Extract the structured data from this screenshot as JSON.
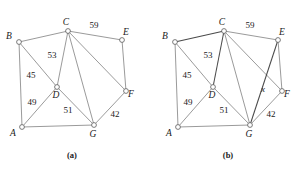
{
  "figure": {
    "kind": "weighted-graph-pair",
    "panels": [
      {
        "id": "a",
        "caption": "(a)",
        "origin_x": 0,
        "vertices": [
          {
            "id": "A",
            "label": "A",
            "x": 22,
            "y": 127,
            "label_dx": -9,
            "label_dy": 9
          },
          {
            "id": "B",
            "label": "B",
            "x": 19,
            "y": 42,
            "label_dx": -10,
            "label_dy": -3
          },
          {
            "id": "C",
            "label": "C",
            "x": 68,
            "y": 31,
            "label_dx": -2,
            "label_dy": -6
          },
          {
            "id": "D",
            "label": "D",
            "x": 57,
            "y": 87,
            "label_dx": -1,
            "label_dy": 11
          },
          {
            "id": "E",
            "label": "E",
            "x": 122,
            "y": 40,
            "label_dx": 4,
            "label_dy": -5
          },
          {
            "id": "F",
            "label": "F",
            "x": 126,
            "y": 91,
            "label_dx": 5,
            "label_dy": 6
          },
          {
            "id": "G",
            "label": "G",
            "x": 94,
            "y": 125,
            "label_dx": -1,
            "label_dy": 12
          }
        ],
        "edges": [
          {
            "from": "A",
            "to": "B",
            "weight": "",
            "bold": false
          },
          {
            "from": "A",
            "to": "D",
            "weight": "49",
            "bold": false,
            "label_x": 32,
            "label_dy": 0,
            "label_y": 105
          },
          {
            "from": "A",
            "to": "G",
            "weight": "",
            "bold": false
          },
          {
            "from": "B",
            "to": "C",
            "weight": "",
            "bold": false
          },
          {
            "from": "B",
            "to": "D",
            "weight": "45",
            "bold": false,
            "label_x": 31,
            "label_y": 78
          },
          {
            "from": "C",
            "to": "D",
            "weight": "53",
            "bold": false,
            "label_x": 52,
            "label_y": 58
          },
          {
            "from": "C",
            "to": "E",
            "weight": "59",
            "bold": false,
            "label_x": 94,
            "label_y": 28
          },
          {
            "from": "C",
            "to": "F",
            "weight": "",
            "bold": false
          },
          {
            "from": "C",
            "to": "G",
            "weight": "",
            "bold": false
          },
          {
            "from": "D",
            "to": "G",
            "weight": "51",
            "bold": false,
            "label_x": 68,
            "label_y": 113
          },
          {
            "from": "E",
            "to": "F",
            "weight": "",
            "bold": false
          },
          {
            "from": "F",
            "to": "G",
            "weight": "42",
            "bold": false,
            "label_x": 115,
            "label_y": 117
          }
        ]
      },
      {
        "id": "b",
        "caption": "(b)",
        "origin_x": 156,
        "vertices": [
          {
            "id": "A",
            "label": "A",
            "x": 178,
            "y": 127,
            "label_dx": -9,
            "label_dy": 9
          },
          {
            "id": "B",
            "label": "B",
            "x": 175,
            "y": 42,
            "label_dx": -10,
            "label_dy": -3
          },
          {
            "id": "C",
            "label": "C",
            "x": 224,
            "y": 31,
            "label_dx": -2,
            "label_dy": -6
          },
          {
            "id": "D",
            "label": "D",
            "x": 213,
            "y": 87,
            "label_dx": -1,
            "label_dy": 11
          },
          {
            "id": "E",
            "label": "E",
            "x": 278,
            "y": 40,
            "label_dx": 4,
            "label_dy": -5
          },
          {
            "id": "F",
            "label": "F",
            "x": 282,
            "y": 91,
            "label_dx": 5,
            "label_dy": 6
          },
          {
            "id": "G",
            "label": "G",
            "x": 250,
            "y": 125,
            "label_dx": -1,
            "label_dy": 12
          }
        ],
        "edges": [
          {
            "from": "A",
            "to": "B",
            "weight": "",
            "bold": false
          },
          {
            "from": "A",
            "to": "D",
            "weight": "49",
            "bold": false,
            "label_x": 188,
            "label_y": 105
          },
          {
            "from": "A",
            "to": "G",
            "weight": "",
            "bold": false
          },
          {
            "from": "B",
            "to": "C",
            "weight": "",
            "bold": true
          },
          {
            "from": "B",
            "to": "D",
            "weight": "45",
            "bold": false,
            "label_x": 187,
            "label_y": 78
          },
          {
            "from": "C",
            "to": "D",
            "weight": "53",
            "bold": true,
            "label_x": 208,
            "label_y": 58
          },
          {
            "from": "C",
            "to": "E",
            "weight": "59",
            "bold": false,
            "label_x": 250,
            "label_y": 28
          },
          {
            "from": "C",
            "to": "F",
            "weight": "",
            "bold": false
          },
          {
            "from": "C",
            "to": "G",
            "weight": "",
            "bold": false
          },
          {
            "from": "D",
            "to": "G",
            "weight": "51",
            "bold": false,
            "label_x": 224,
            "label_y": 113
          },
          {
            "from": "E",
            "to": "F",
            "weight": "",
            "bold": false
          },
          {
            "from": "E",
            "to": "G",
            "weight": "x",
            "bold": true,
            "italic": true,
            "label_x": 263,
            "label_y": 92
          },
          {
            "from": "F",
            "to": "G",
            "weight": "42",
            "bold": false,
            "label_x": 271,
            "label_y": 117
          }
        ]
      }
    ],
    "colors": {
      "edge": "#6f6f6f",
      "edge_bold": "#4a4a4a",
      "node_stroke": "#5a5a5a",
      "node_fill": "#ffffff",
      "text": "#1a1a1a",
      "background": "#ffffff"
    },
    "node_radius": 2.4
  }
}
